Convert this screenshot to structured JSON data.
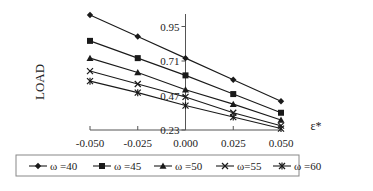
{
  "chart_data": {
    "type": "line",
    "title": "",
    "xlabel": "ε*",
    "ylabel": "LOAD",
    "x": [
      -0.05,
      -0.025,
      0.0,
      0.025,
      0.05
    ],
    "x_tick_labels": [
      "-0.050",
      "-0.025",
      "0.000",
      "0.025",
      "0.050"
    ],
    "y_tick_labels": [
      "0.23",
      "0.47",
      "0.71",
      "0.95"
    ],
    "y_ticks": [
      0.23,
      0.47,
      0.71,
      0.95
    ],
    "ylim": [
      0.23,
      1.05
    ],
    "xlim": [
      -0.05,
      0.05
    ],
    "grid": false,
    "legend_position": "bottom",
    "series": [
      {
        "name": "ω =40",
        "marker": "diamond",
        "values": [
          1.03,
          0.88,
          0.73,
          0.58,
          0.43
        ]
      },
      {
        "name": "ω =45",
        "marker": "square",
        "values": [
          0.85,
          0.73,
          0.61,
          0.48,
          0.35
        ]
      },
      {
        "name": "ω =50",
        "marker": "triangle",
        "values": [
          0.73,
          0.63,
          0.51,
          0.41,
          0.3
        ]
      },
      {
        "name": "ω=55",
        "marker": "x",
        "values": [
          0.64,
          0.55,
          0.46,
          0.35,
          0.26
        ]
      },
      {
        "name": "ω =60",
        "marker": "star",
        "values": [
          0.57,
          0.49,
          0.4,
          0.32,
          0.24
        ]
      }
    ]
  },
  "colors": {
    "line": "#1a1a1a",
    "axis": "#555555",
    "legend_border": "#888888"
  }
}
